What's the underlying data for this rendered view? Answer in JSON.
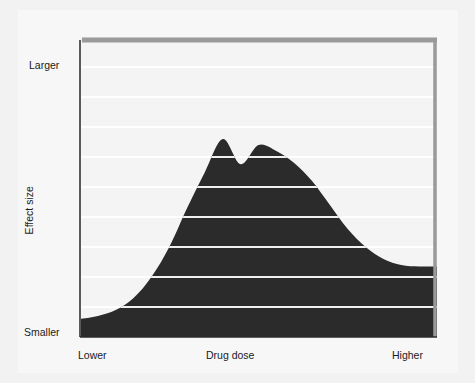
{
  "figure": {
    "background_color": "#f2f2f2",
    "panel_color": "#f7f7f7"
  },
  "axes": {
    "y_axis_title": "Effect size",
    "y_top_label": "Larger",
    "y_bottom_label": "Smaller",
    "x_axis_title": "Drug dose",
    "x_left_label": "Lower",
    "x_right_label": "Higher"
  },
  "style": {
    "fill_color": "#2b2b2b",
    "frame_color": "#9a9a9a",
    "axis_color": "#5a5a5a",
    "gridline_color": "#ffffff"
  },
  "chart_data": {
    "type": "area",
    "title": "",
    "subtitle": "",
    "xlabel": "Drug dose",
    "ylabel": "Effect size",
    "xlim": [
      0,
      1
    ],
    "ylim": [
      0,
      1
    ],
    "xtick_labels": [
      "Lower",
      "Higher"
    ],
    "ytick_labels": [
      "Smaller",
      "Larger"
    ],
    "grid": true,
    "gridline_axis": "y",
    "gridline_count": 9,
    "gridline_values": [
      0.1,
      0.2,
      0.3,
      0.4,
      0.5,
      0.6,
      0.7,
      0.8,
      0.9
    ],
    "legend": null,
    "legend_position": "none",
    "annotations": [],
    "series": [
      {
        "name": "Effect size vs drug dose",
        "fill": "#2b2b2b",
        "x": [
          0.0,
          0.05,
          0.1,
          0.15,
          0.2,
          0.25,
          0.3,
          0.35,
          0.4,
          0.45,
          0.5,
          0.55,
          0.6,
          0.65,
          0.7,
          0.75,
          0.8,
          0.85,
          0.9,
          0.95,
          1.0
        ],
        "y": [
          0.06,
          0.07,
          0.09,
          0.13,
          0.2,
          0.3,
          0.43,
          0.55,
          0.66,
          0.576,
          0.64,
          0.62,
          0.58,
          0.52,
          0.44,
          0.36,
          0.3,
          0.26,
          0.24,
          0.235,
          0.235
        ]
      }
    ]
  }
}
